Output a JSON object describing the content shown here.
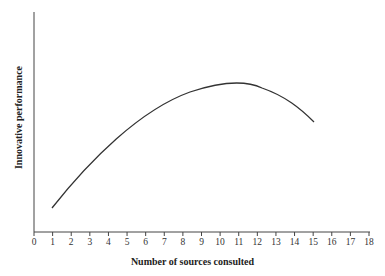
{
  "chart_data": {
    "type": "line",
    "title": "",
    "xlabel": "Number of sources consulted",
    "ylabel": "Innovative performance",
    "xlim": [
      0,
      18
    ],
    "x_ticks": [
      0,
      1,
      2,
      3,
      4,
      5,
      6,
      7,
      8,
      9,
      10,
      11,
      12,
      13,
      14,
      15,
      16,
      17,
      18
    ],
    "y_ticks": [],
    "grid": false,
    "legend": null,
    "series": [
      {
        "name": "Innovative performance",
        "x": [
          1,
          3,
          5,
          7,
          9,
          11,
          13,
          15
        ],
        "y_rel": [
          0.12,
          0.4,
          0.6,
          0.74,
          0.82,
          0.85,
          0.79,
          0.6
        ]
      }
    ]
  }
}
